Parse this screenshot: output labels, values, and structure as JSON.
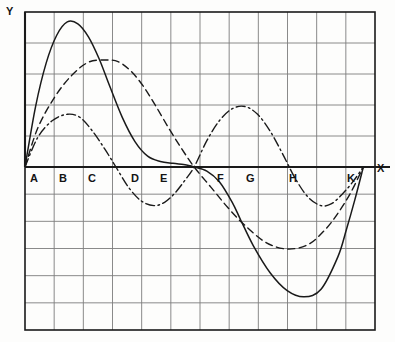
{
  "figure": {
    "axis_y_label": "Y",
    "axis_x_label": "X",
    "background_color": "#fdfdfc",
    "ink_color": "#1a1a1a",
    "grid_color": "#8a8a8a"
  },
  "chart_data": {
    "type": "line",
    "title": "",
    "subtitle": "",
    "xlabel": "X",
    "ylabel": "Y",
    "grid": true,
    "legend_position": "none",
    "annotations": [
      "All three curves originate at point A on the X-axis",
      "All three curves intersect the X-axis together at point E",
      "All three curves reconverge at point K on the X-axis"
    ],
    "x_tick_labels": [
      "A",
      "B",
      "C",
      "D",
      "E",
      "F",
      "G",
      "H",
      "K"
    ],
    "x_tick_values": [
      0,
      1,
      2,
      3,
      4,
      5,
      6,
      7,
      8
    ],
    "xlim": [
      -0.5,
      12.0
    ],
    "ylim": [
      -6,
      5
    ],
    "grid_columns": 12,
    "grid_rows_above_axis": 5,
    "grid_rows_below_axis": 6,
    "series": [
      {
        "name": "solid-curve",
        "style": "solid",
        "color": "#1a1a1a",
        "x": [
          0.0,
          0.25,
          0.5,
          0.75,
          1.0,
          1.25,
          1.5,
          1.75,
          2.0,
          2.3,
          2.6,
          2.9,
          3.2,
          3.5,
          3.75,
          3.9,
          4.0,
          4.3,
          4.6,
          4.9,
          5.1,
          5.4,
          5.8,
          6.2,
          6.6,
          7.0,
          7.4,
          7.6,
          7.8,
          8.0
        ],
        "y": [
          0.0,
          1.95,
          3.35,
          4.25,
          4.68,
          4.62,
          4.2,
          3.5,
          2.62,
          1.6,
          0.82,
          0.35,
          0.18,
          0.12,
          0.08,
          0.04,
          0.0,
          -0.15,
          -0.55,
          -1.3,
          -1.95,
          -2.9,
          -3.9,
          -4.55,
          -4.78,
          -4.5,
          -3.3,
          -2.3,
          -1.2,
          0.0
        ]
      },
      {
        "name": "dashed-curve",
        "style": "dashed",
        "color": "#1a1a1a",
        "x": [
          0.0,
          0.3,
          0.7,
          1.1,
          1.5,
          1.9,
          2.2,
          2.5,
          2.8,
          3.1,
          3.4,
          3.7,
          4.0,
          4.4,
          4.8,
          5.2,
          5.7,
          6.2,
          6.7,
          7.1,
          7.4,
          7.7,
          8.0
        ],
        "y": [
          0.0,
          1.25,
          2.25,
          2.95,
          3.38,
          3.45,
          3.4,
          3.1,
          2.6,
          1.95,
          1.25,
          0.6,
          0.0,
          -0.75,
          -1.5,
          -2.15,
          -2.78,
          -3.02,
          -2.85,
          -2.3,
          -1.7,
          -0.95,
          0.0
        ]
      },
      {
        "name": "dash-dot-curve",
        "style": "dashdot",
        "color": "#1a1a1a",
        "x": [
          0.0,
          0.3,
          0.65,
          1.0,
          1.3,
          1.6,
          1.9,
          2.15,
          2.45,
          2.75,
          3.05,
          3.3,
          3.55,
          3.8,
          4.0,
          4.3,
          4.6,
          4.9,
          5.2,
          5.5,
          5.8,
          6.1,
          6.4,
          6.7,
          7.0,
          7.25,
          7.5,
          7.75,
          8.0
        ],
        "y": [
          0.0,
          0.95,
          1.5,
          1.7,
          1.6,
          1.15,
          0.55,
          0.0,
          -0.75,
          -1.25,
          -1.42,
          -1.3,
          -0.95,
          -0.45,
          0.0,
          0.85,
          1.5,
          1.88,
          1.95,
          1.7,
          1.15,
          0.4,
          -0.45,
          -1.12,
          -1.42,
          -1.35,
          -1.0,
          -0.55,
          0.0
        ]
      }
    ]
  },
  "labels": {
    "points": [
      {
        "text": "A",
        "x_px": 30,
        "y_px": 173
      },
      {
        "text": "B",
        "x_px": 59,
        "y_px": 173
      },
      {
        "text": "C",
        "x_px": 88,
        "y_px": 173
      },
      {
        "text": "D",
        "x_px": 131,
        "y_px": 173
      },
      {
        "text": "E",
        "x_px": 160,
        "y_px": 173
      },
      {
        "text": "F",
        "x_px": 217,
        "y_px": 173
      },
      {
        "text": "G",
        "x_px": 246,
        "y_px": 173
      },
      {
        "text": "H",
        "x_px": 289,
        "y_px": 173
      },
      {
        "text": "K",
        "x_px": 347,
        "y_px": 173
      }
    ],
    "axis_y": {
      "text": "Y",
      "x_px": 6,
      "y_px": 6
    },
    "axis_x": {
      "text": "X",
      "x_px": 377,
      "y_px": 163
    }
  }
}
